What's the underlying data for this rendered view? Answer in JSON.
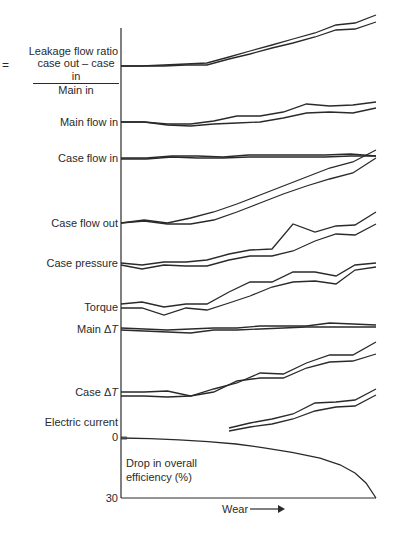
{
  "chart_data": {
    "type": "line",
    "title": "",
    "xlabel": "Wear",
    "xlabel_arrow": "→",
    "ylabel": "",
    "grid": false,
    "axis": {
      "y_bottom_labels": [
        "0",
        "30"
      ],
      "efficiency_axis": {
        "label": "Drop in overall efficiency (%)",
        "range": [
          0,
          30
        ]
      }
    },
    "x_pixels": [
      121,
      142,
      164,
      186,
      207,
      229,
      250,
      272,
      293,
      315,
      336,
      355,
      376
    ],
    "series": [
      {
        "name": "Leakage flow ratio",
        "label_lines": [
          "Leakage flow ratio",
          "case out – case in",
          "Main in"
        ],
        "prefix": "=",
        "upper": [
          66,
          66,
          65,
          64,
          63,
          57,
          51,
          45,
          39,
          33,
          25,
          23,
          15
        ],
        "lower": [
          66,
          66,
          66,
          65,
          65,
          59,
          54,
          48,
          43,
          37,
          30,
          29,
          22
        ]
      },
      {
        "name": "Main flow in",
        "upper": [
          122,
          122,
          124,
          124,
          121,
          116,
          116,
          112,
          104,
          106,
          105,
          102
        ],
        "lower": [
          122,
          122,
          125,
          126,
          124,
          123,
          122,
          118,
          113,
          112,
          113,
          108
        ]
      },
      {
        "name": "Case flow in",
        "upper": [
          158,
          158,
          156,
          156,
          157,
          155,
          155,
          155,
          155,
          154,
          156
        ],
        "lower": [
          159,
          159,
          157,
          158,
          158,
          157,
          157,
          157,
          157,
          156,
          156
        ]
      },
      {
        "name": "Case flow out",
        "upper": [
          223,
          220,
          223,
          218,
          212,
          204,
          195,
          186,
          177,
          168,
          162,
          150
        ],
        "lower": [
          223,
          221,
          224,
          224,
          220,
          212,
          203,
          194,
          186,
          179,
          173,
          158
        ]
      },
      {
        "name": "Case pressure",
        "upper": [
          263,
          265,
          262,
          262,
          260,
          254,
          250,
          249,
          224,
          232,
          226,
          225,
          212
        ],
        "lower": [
          265,
          269,
          265,
          266,
          266,
          260,
          256,
          256,
          251,
          241,
          234,
          235,
          224
        ]
      },
      {
        "name": "Torque",
        "upper": [
          304,
          302,
          307,
          304,
          304,
          292,
          282,
          282,
          272,
          272,
          276,
          265,
          263
        ],
        "lower": [
          308,
          308,
          315,
          308,
          310,
          303,
          296,
          287,
          282,
          281,
          284,
          270,
          267
        ]
      },
      {
        "name": "Main ΔT",
        "label_delta": true,
        "upper": [
          328,
          329,
          330,
          329,
          328,
          328,
          326,
          326,
          326,
          323,
          324,
          325
        ],
        "lower": [
          330,
          331,
          332,
          333,
          330,
          330,
          329,
          328,
          327,
          327,
          327,
          327
        ]
      },
      {
        "name": "Case ΔT",
        "label_delta": true,
        "upper": [
          392,
          392,
          391,
          396,
          389,
          383,
          373,
          374,
          363,
          355,
          355,
          342
        ],
        "lower": [
          396,
          396,
          397,
          396,
          392,
          381,
          378,
          378,
          368,
          362,
          361,
          354
        ]
      },
      {
        "name": "Electric current",
        "x_start": 229,
        "upper": [
          428,
          423,
          419,
          414,
          403,
          402,
          400,
          389
        ],
        "lower": [
          431,
          427,
          424,
          419,
          411,
          407,
          406,
          395
        ],
        "x": [
          229,
          250,
          272,
          293,
          315,
          336,
          355,
          376
        ]
      },
      {
        "name": "Drop in overall efficiency (%)",
        "values_pct": [
          0,
          0.3,
          0.9,
          1.8,
          3.0,
          4.9,
          7.2,
          10.1,
          13.4,
          17.5,
          22.5,
          30.0
        ],
        "x": [
          121,
          150,
          179,
          208,
          236,
          264,
          292,
          320,
          340,
          355,
          366,
          376
        ]
      }
    ]
  },
  "labels": {
    "leakage_line1": "Leakage flow ratio",
    "leakage_num": "case out – case in",
    "leakage_den": "Main in",
    "leakage_eq": "=",
    "main_flow_in": "Main flow in",
    "case_flow_in": "Case flow in",
    "case_flow_out": "Case flow out",
    "case_pressure": "Case pressure",
    "torque": "Torque",
    "main_dt_prefix": "Main ",
    "main_dt_delta": "Δ",
    "main_dt_t": "T",
    "case_dt_prefix": "Case ",
    "case_dt_delta": "Δ",
    "case_dt_t": "T",
    "electric_current": "Electric current",
    "zero": "0",
    "thirty": "30",
    "efficiency_line1": "Drop in overall",
    "efficiency_line2": "efficiency (%)",
    "wear": "Wear"
  },
  "colors": {
    "line": "#2a2a2a",
    "background": "#ffffff"
  }
}
